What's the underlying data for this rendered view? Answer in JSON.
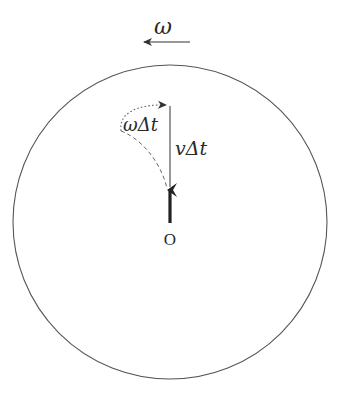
{
  "diagram": {
    "rotation_label": "ω",
    "rotation_direction": "counterclockwise (arrow pointing left)",
    "angle_label": "ωΔt",
    "displacement_label": "vΔt",
    "origin_label": "O",
    "colors": {
      "stroke": "#333333",
      "dashed": "#555555",
      "background": "#ffffff"
    },
    "elements": {
      "disk": {
        "cx": 170,
        "cy": 222,
        "r": 157
      },
      "velocity_arrow": {
        "from": [
          170,
          223
        ],
        "to": [
          170,
          186
        ],
        "style": "thick"
      },
      "displacement_line": {
        "from": [
          170,
          186
        ],
        "to": [
          170,
          106
        ],
        "style": "solid thin"
      },
      "rotated_path": {
        "style": "dotted arc with arrowhead",
        "from": [
          121,
          131
        ],
        "to": [
          168,
          106
        ]
      },
      "actual_path": {
        "style": "dashed curve",
        "from": [
          121,
          131
        ],
        "to": [
          167,
          188
        ]
      },
      "omega_arrow": {
        "from": [
          190,
          42
        ],
        "to": [
          142,
          42
        ]
      }
    }
  }
}
